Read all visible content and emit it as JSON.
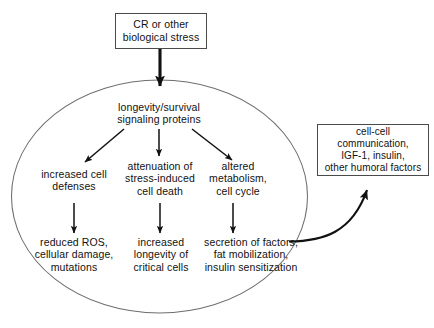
{
  "figure": {
    "cell_boundary_label": "cell"
  },
  "nodes": {
    "stimulus": {
      "text": "CR or other\nbiological stress"
    },
    "signaling_proteins": {
      "text": "longevity/survival\nsignaling proteins"
    },
    "increased_cell_defenses": {
      "text": "increased cell\ndefenses"
    },
    "attenuation_stress_death": {
      "text": "attenuation of\nstress-induced\ncell death"
    },
    "altered_metabolism": {
      "text": "altered\nmetabolism,\ncell cycle"
    },
    "reduced_ros": {
      "text": "reduced ROS,\ncellular damage,\nmutations"
    },
    "increased_longevity": {
      "text": "increased\nlongevity of\ncritical cells"
    },
    "secretion_of_factors": {
      "text": "secretion of factors,\nfat mobilization,\ninsulin sensitization"
    },
    "humoral_factors": {
      "text": "cell-cell\ncommunication,\nIGF-1, insulin,\nother humoral factors"
    }
  },
  "colors": {
    "stroke": "#111111",
    "box_border": "#4a4a4a",
    "cell_outline": "#6e6e6e",
    "background": "#ffffff",
    "text": "#111111"
  },
  "edges": [
    {
      "name": "stimulus-to-signaling",
      "from": "stimulus",
      "to": "signaling_proteins",
      "style": "thick-straight-down"
    },
    {
      "name": "signaling-to-defenses",
      "from": "signaling_proteins",
      "to": "increased_cell_defenses",
      "style": "diagonal-down-left"
    },
    {
      "name": "signaling-to-attenuation",
      "from": "signaling_proteins",
      "to": "attenuation_stress_death",
      "style": "straight-down"
    },
    {
      "name": "signaling-to-altered",
      "from": "signaling_proteins",
      "to": "altered_metabolism",
      "style": "diagonal-down-right"
    },
    {
      "name": "defenses-to-reduced-ros",
      "from": "increased_cell_defenses",
      "to": "reduced_ros",
      "style": "straight-down"
    },
    {
      "name": "attenuation-to-longevity",
      "from": "attenuation_stress_death",
      "to": "increased_longevity",
      "style": "straight-down"
    },
    {
      "name": "altered-to-secretion",
      "from": "altered_metabolism",
      "to": "secretion_of_factors",
      "style": "straight-down"
    },
    {
      "name": "secretion-to-humoral",
      "from": "secretion_of_factors",
      "to": "humoral_factors",
      "style": "curved-up-right"
    }
  ]
}
